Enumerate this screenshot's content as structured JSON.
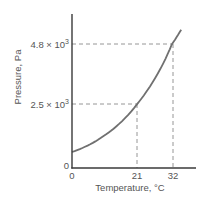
{
  "chart_data": {
    "type": "line",
    "title": "",
    "xlabel": "Temperature, °C",
    "ylabel": "Pressure, Pa",
    "xlim": [
      0,
      38
    ],
    "ylim": [
      0,
      6000
    ],
    "grid": false,
    "legend": null,
    "x_ticks": [
      "0",
      "21",
      "32"
    ],
    "y_ticks": [
      "0",
      "2.5 × 10³",
      "4.8 × 10³"
    ],
    "series": [
      {
        "name": "Vapor pressure curve",
        "x": [
          0,
          5,
          10,
          15,
          21,
          25,
          30,
          32,
          35
        ],
        "y": [
          620,
          870,
          1230,
          1700,
          2500,
          3170,
          4250,
          4800,
          5370
        ]
      }
    ],
    "annotations": [
      {
        "type": "dashed-guide",
        "x": 21,
        "y": 2500,
        "label_x": "21",
        "label_y": "2.5 × 10³"
      },
      {
        "type": "dashed-guide",
        "x": 32,
        "y": 4800,
        "label_x": "32",
        "label_y": "4.8 × 10³"
      }
    ],
    "colors": {
      "axis": "#3a3a3a",
      "curve": "#707070",
      "guide": "#8a8a8a",
      "text": "#555555"
    }
  },
  "labels": {
    "xlabel": "Temperature, °C",
    "ylabel": "Pressure, Pa",
    "x_tick_0": "0",
    "x_tick_21": "21",
    "x_tick_32": "32",
    "y_tick_0": "0",
    "y_tick_25_mantissa": "2.5 × 10",
    "y_tick_48_mantissa": "4.8 × 10",
    "exponent": "3"
  }
}
